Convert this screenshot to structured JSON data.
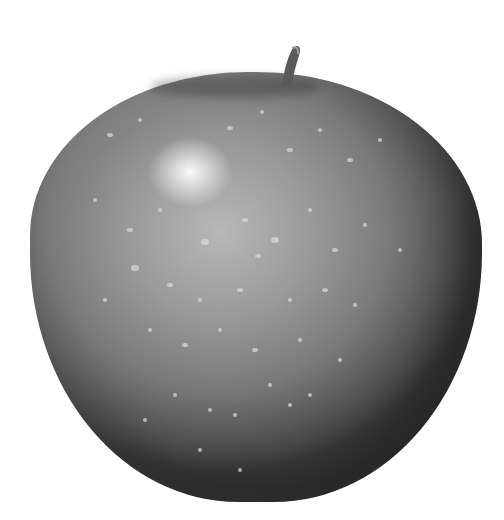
{
  "image": {
    "subject": "apple",
    "description": "Grayscale photograph of a speckled apple with a short stem on a white background",
    "colors": {
      "background": "#ffffff",
      "apple_highlight": "#f4f4f4",
      "apple_mid": "#8c8c8c",
      "apple_shadow": "#3a3a3a",
      "stem": "#5a5a5a",
      "speckle": "#d8d8d8"
    }
  }
}
